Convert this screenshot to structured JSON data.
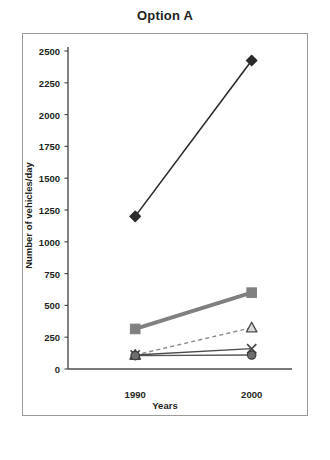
{
  "chart_data": {
    "type": "line",
    "title": "Option A",
    "xlabel": "Years",
    "ylabel": "Number of vehicles/day",
    "categories": [
      "1990",
      "2000"
    ],
    "ylim": [
      0,
      2500
    ],
    "ytick_step": 250,
    "yticks": [
      0,
      250,
      500,
      750,
      1000,
      1250,
      1500,
      1750,
      2000,
      2250,
      2500
    ],
    "ytick_labels": [
      "0",
      "250",
      "500",
      "750",
      "1000",
      "1250",
      "1500",
      "1750",
      "2000",
      "2250",
      "2500"
    ],
    "grid": false,
    "legend": "none",
    "series": [
      {
        "name": "series-diamond",
        "marker": "diamond",
        "line": "solid",
        "color": "#2b2b2b",
        "width": 1.6,
        "values": [
          1200,
          2425
        ]
      },
      {
        "name": "series-square",
        "marker": "square",
        "line": "solid",
        "color": "#808080",
        "width": 4.0,
        "values": [
          315,
          600
        ]
      },
      {
        "name": "series-triangle",
        "marker": "triangle",
        "line": "dashed",
        "color": "#8a8a8a",
        "width": 1.4,
        "values": [
          110,
          325
        ]
      },
      {
        "name": "series-cross",
        "marker": "cross",
        "line": "solid",
        "color": "#4a4a4a",
        "width": 1.4,
        "values": [
          110,
          160
        ]
      },
      {
        "name": "series-circle",
        "marker": "circle",
        "line": "solid",
        "color": "#555555",
        "width": 1.4,
        "values": [
          105,
          110
        ]
      }
    ]
  },
  "axis": {
    "axis_color": "#4d4d4d",
    "frame_color": "#9a9a9a"
  }
}
